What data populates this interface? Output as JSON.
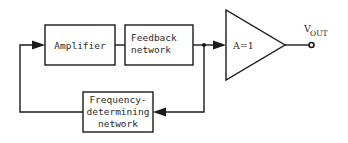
{
  "diagram": {
    "blocks": {
      "amplifier": {
        "label": "Amplifier"
      },
      "feedback": {
        "line1": "Feedback",
        "line2": "network"
      },
      "frequency": {
        "line1": "Frequency-",
        "line2": "determining",
        "line3": "network"
      },
      "buffer": {
        "label": "A=1"
      }
    },
    "output": {
      "v": "V",
      "sub": "OUT"
    },
    "colors": {
      "stroke": "#1a1a1a",
      "background": "#ffffff"
    }
  }
}
